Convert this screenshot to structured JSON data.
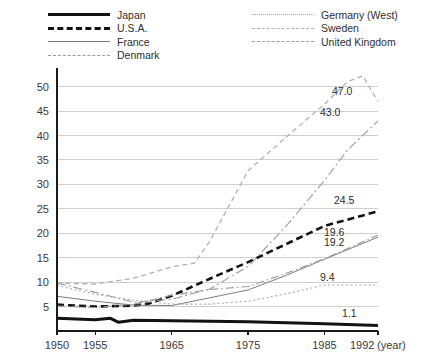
{
  "legend": {
    "columns": [
      [
        {
          "label": "Japan",
          "key": "k-japan"
        },
        {
          "label": "U.S.A.",
          "key": "k-usa"
        },
        {
          "label": "France",
          "key": "k-france"
        },
        {
          "label": "Denmark",
          "key": "k-denmark"
        }
      ],
      [
        {
          "label": "Germany (West)",
          "key": "k-germany"
        },
        {
          "label": "Sweden",
          "key": "k-sweden"
        },
        {
          "label": "United Kingdom",
          "key": "k-uk"
        }
      ]
    ]
  },
  "axis": {
    "x_unit_label": "(year)",
    "y_ticks": [
      5,
      10,
      15,
      20,
      25,
      30,
      35,
      40,
      45,
      50
    ],
    "x_ticks": [
      {
        "value": 1950,
        "label": "1950"
      },
      {
        "value": 1955,
        "label": "1955"
      },
      {
        "value": 1965,
        "label": "1965"
      },
      {
        "value": 1975,
        "label": "1975"
      },
      {
        "value": 1985,
        "label": "1985"
      },
      {
        "value": 1992,
        "label": "1992"
      }
    ]
  },
  "chart_data": {
    "type": "line",
    "title": "",
    "xlabel": "(year)",
    "ylabel": "",
    "xlim": [
      1950,
      1992
    ],
    "ylim": [
      0,
      53
    ],
    "grid": true,
    "legend_position": "top",
    "end_labels": [
      {
        "series": "Sweden",
        "value": "47.0"
      },
      {
        "series": "Denmark",
        "value": "43.0"
      },
      {
        "series": "U.S.A.",
        "value": "24.5"
      },
      {
        "series": "United Kingdom",
        "value": "19.6"
      },
      {
        "series": "France",
        "value": "19.2"
      },
      {
        "series": "Germany (West)",
        "value": "9.4"
      },
      {
        "series": "Japan",
        "value": "1.1"
      }
    ],
    "series": [
      {
        "name": "Japan",
        "style": "thick-solid",
        "color": "#121212",
        "width": 3.0,
        "dash": "",
        "x": [
          1950,
          1955,
          1957,
          1958,
          1960,
          1965,
          1970,
          1975,
          1980,
          1985,
          1992
        ],
        "values": [
          2.6,
          2.3,
          2.6,
          1.8,
          2.2,
          2.1,
          2.0,
          1.9,
          1.7,
          1.5,
          1.1
        ]
      },
      {
        "name": "U.S.A.",
        "style": "thick-dashed",
        "color": "#121212",
        "width": 2.6,
        "dash": "7,4",
        "x": [
          1950,
          1955,
          1960,
          1962,
          1965,
          1970,
          1975,
          1980,
          1985,
          1992
        ],
        "values": [
          5.4,
          5.0,
          5.2,
          5.6,
          7.2,
          10.7,
          14.1,
          17.8,
          21.5,
          24.5
        ]
      },
      {
        "name": "France",
        "style": "thin-solid",
        "color": "#7d7d7d",
        "width": 1.0,
        "dash": "",
        "x": [
          1950,
          1955,
          1960,
          1965,
          1970,
          1975,
          1980,
          1985,
          1992
        ],
        "values": [
          7.1,
          6.1,
          5.3,
          5.2,
          6.8,
          8.4,
          11.4,
          14.7,
          19.2
        ]
      },
      {
        "name": "Denmark",
        "style": "thin-dash-dot",
        "color": "#9a9a9a",
        "width": 1.1,
        "dash": "9,3,2,3",
        "x": [
          1950,
          1955,
          1960,
          1965,
          1970,
          1975,
          1980,
          1985,
          1988,
          1992
        ],
        "values": [
          9.8,
          7.9,
          5.9,
          6.5,
          8.6,
          13.2,
          21.5,
          30.8,
          37.0,
          43.0
        ]
      },
      {
        "name": "Germany (West)",
        "style": "dotted",
        "color": "#a8a8a8",
        "width": 1.1,
        "dash": "2,2.5",
        "x": [
          1950,
          1955,
          1960,
          1965,
          1970,
          1975,
          1980,
          1985,
          1992
        ],
        "values": [
          9.3,
          7.5,
          6.3,
          5.5,
          5.5,
          6.1,
          7.6,
          9.4,
          9.4
        ]
      },
      {
        "name": "Sweden",
        "style": "dashed",
        "color": "#b0b0b0",
        "width": 1.3,
        "dash": "5,3.5",
        "x": [
          1950,
          1955,
          1960,
          1965,
          1968,
          1970,
          1975,
          1980,
          1985,
          1988,
          1990,
          1992
        ],
        "values": [
          9.8,
          9.6,
          10.8,
          13.1,
          13.9,
          18.4,
          32.8,
          39.7,
          46.4,
          51.0,
          52.2,
          47.0
        ]
      },
      {
        "name": "United Kingdom",
        "style": "dash-dot",
        "color": "#9a9a9a",
        "width": 1.1,
        "dash": "8,3,1.5,3",
        "x": [
          1950,
          1955,
          1960,
          1965,
          1970,
          1975,
          1980,
          1985,
          1992
        ],
        "values": [
          5.1,
          4.8,
          5.5,
          7.3,
          8.5,
          9.1,
          11.8,
          14.8,
          19.6
        ]
      }
    ]
  }
}
